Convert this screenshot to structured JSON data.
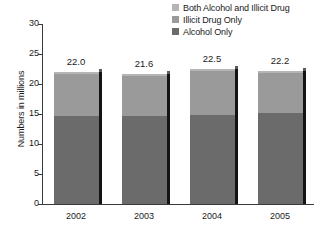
{
  "chart_data": {
    "type": "bar",
    "stacked": true,
    "title": "",
    "xlabel": "",
    "ylabel": "Numbers in millions",
    "categories": [
      "2002",
      "2003",
      "2004",
      "2005"
    ],
    "ylim": [
      0,
      30
    ],
    "yticks": [
      "0",
      "5",
      "10",
      "15",
      "20",
      "25",
      "30"
    ],
    "ytick_values": [
      0,
      5,
      10,
      15,
      20,
      25,
      30
    ],
    "grid": false,
    "legend_position": "top-right",
    "series": [
      {
        "name": "Alcohol Only",
        "color": "#6b6b6b",
        "values": [
          14.6,
          14.6,
          14.8,
          15.1
        ]
      },
      {
        "name": "Illicit Drug Only",
        "color": "#9a9a9a",
        "values": [
          7.1,
          6.7,
          7.4,
          6.8
        ]
      },
      {
        "name": "Both Alcohol and Illicit Drug",
        "color": "#b5b5b5",
        "values": [
          0.3,
          0.3,
          0.3,
          0.3
        ]
      }
    ],
    "totals": [
      "22.0",
      "21.6",
      "22.5",
      "22.2"
    ],
    "total_values": [
      22.0,
      21.6,
      22.5,
      22.2
    ]
  },
  "legend": {
    "items": [
      {
        "label": "Both Alcohol and Illicit Drug",
        "color": "#b5b5b5"
      },
      {
        "label": "Illicit Drug Only",
        "color": "#9a9a9a"
      },
      {
        "label": "Alcohol Only",
        "color": "#6b6b6b"
      }
    ]
  },
  "axes": {
    "y_title": "Numbers in millions"
  }
}
